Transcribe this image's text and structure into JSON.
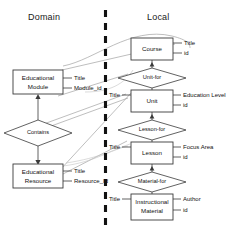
{
  "diagram": {
    "type": "entity-relationship-mapping",
    "headers": {
      "left": "Domain",
      "right": "Local"
    },
    "divider": {
      "name": "vertical-dashed-divider",
      "style": "dashed",
      "color": "#111111"
    },
    "domain_entities": [
      {
        "id": "educational-module",
        "label_line1": "Educational",
        "label_line2": "Module",
        "attributes": [
          "Title",
          "Module_id"
        ]
      },
      {
        "id": "educational-resource",
        "label_line1": "Educational",
        "label_line2": "Resource",
        "attributes": [
          "Title",
          "Resource_Id"
        ]
      }
    ],
    "domain_relationships": [
      {
        "id": "contains",
        "label": "Contains"
      }
    ],
    "local_entities": [
      {
        "id": "course",
        "label_line1": "Course",
        "label_line2": "",
        "attributes_right": [
          "Title",
          "id"
        ],
        "attributes_left": []
      },
      {
        "id": "unit",
        "label_line1": "Unit",
        "label_line2": "",
        "attributes_right": [
          "Education Level",
          "id"
        ],
        "attributes_left": [
          "Title"
        ]
      },
      {
        "id": "lesson",
        "label_line1": "Lesson",
        "label_line2": "",
        "attributes_right": [
          "Focus Area",
          "id"
        ],
        "attributes_left": [
          "Title"
        ]
      },
      {
        "id": "instructional-material",
        "label_line1": "Instructional",
        "label_line2": "Material",
        "attributes_right": [
          "Author",
          "id"
        ],
        "attributes_left": [
          "Title"
        ]
      }
    ],
    "local_relationships": [
      {
        "id": "unit-for",
        "label": "Unit-for"
      },
      {
        "id": "lesson-for",
        "label": "Lesson-for"
      },
      {
        "id": "material-for",
        "label": "Material-for"
      }
    ],
    "colors": {
      "stroke": "#3a3a3a",
      "mapping_line": "#9a9a9a",
      "text": "#111111",
      "background": "#ffffff"
    }
  }
}
